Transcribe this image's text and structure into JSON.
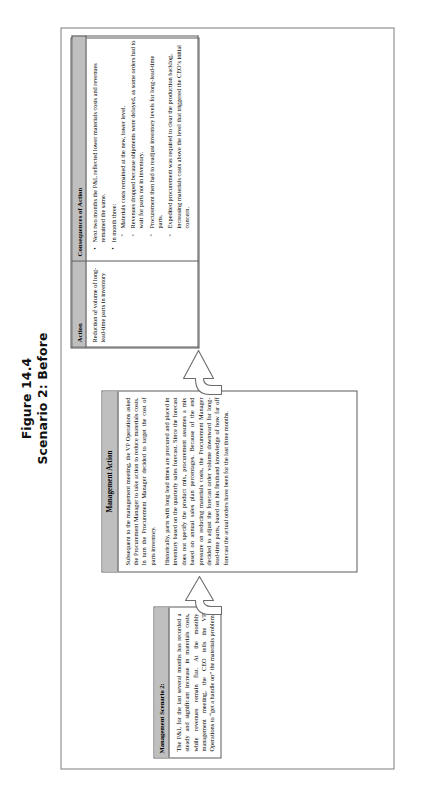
{
  "figure": {
    "number": "Figure 14.4",
    "subtitle": "Scenario 2: Before"
  },
  "scenario": {
    "header": "Management Scenario 2:",
    "body": "The P&L for the last several months has recorded a steady and significant increase in materials costs, while revenues remain flat. At the monthly management meeting, the CEO tells the VP Operations to “get a handle on” the materials problem."
  },
  "management_action": {
    "header": "Management Action",
    "paragraph_1": "Subsequent to the management meeting, the VP Operations asked the Procurement Manager to take action to reduce materials costs. In turn the Procurement Manager decided to target the cost of parts inventory.",
    "paragraph_2": "Historically, parts with long lead times are procured and placed in inventory based on the quarterly sales forecast. Since the forecast does not specify the product mix, procurement assumes a mix based on annual sales plan percentages. Because of the end pressure on reducing materials costs, the Procurement Manager decided to adjust the forecast order volume downward for long-lead-time parts, based on his firsthand knowledge of how far off forecast the actual orders have been for the last three months."
  },
  "consequences_table": {
    "columns": [
      "Action",
      "Consequences of Action"
    ],
    "action_cell": "Reduction of volume of long-lead-time parts in inventory",
    "consequences": [
      {
        "text": "Next two months the P&L reflected lower materials costs and revenues remained the same.",
        "sub": []
      },
      {
        "text": "In month three:",
        "sub": [
          "Materials costs remained at the new, lower level.",
          "Revenues dropped because shipments were delayed, as some orders had to wait for parts not in inventory.",
          "Procurement then had to readjust inventory levels for long-lead-time parts.",
          "Expedited procurement was required to clear the production backlog, increasing materials costs above the level that triggered the CEO’s initial concern."
        ]
      }
    ]
  },
  "arrows": {
    "arrow_1_name": "flow-arrow-scenario-to-action",
    "arrow_2_name": "flow-arrow-action-to-consequences"
  },
  "colors": {
    "header_fill": "#bfbfbf",
    "border": "#5a5a5a",
    "frame_border": "#7c7c7c"
  }
}
